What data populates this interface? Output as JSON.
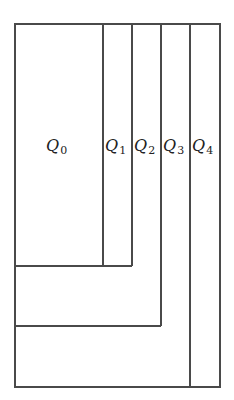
{
  "diagram": {
    "type": "nested-regions",
    "frame": {
      "x": 15,
      "y": 24,
      "right": 220,
      "bottom": 387
    },
    "regions": [
      {
        "id": "Q0",
        "label": "Q",
        "subscript": "0",
        "right": 103,
        "bottom": 266,
        "label_x": 48,
        "label_y": 152
      },
      {
        "id": "Q1",
        "label": "Q",
        "subscript": "1",
        "right": 132,
        "bottom": 266,
        "label_x": 105,
        "label_y": 152
      },
      {
        "id": "Q2",
        "label": "Q",
        "subscript": "2",
        "right": 161,
        "bottom": 326,
        "label_x": 134,
        "label_y": 152
      },
      {
        "id": "Q3",
        "label": "Q",
        "subscript": "3",
        "right": 190,
        "bottom": 387,
        "label_x": 163,
        "label_y": 152
      },
      {
        "id": "Q4",
        "label": "Q",
        "subscript": "4",
        "right": 220,
        "bottom": 387,
        "label_x": 192,
        "label_y": 152
      }
    ],
    "line_color": "#4a4a4a"
  }
}
